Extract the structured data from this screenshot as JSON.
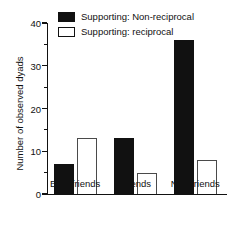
{
  "chart_data": {
    "type": "bar",
    "title": "",
    "xlabel": "",
    "ylabel": "Number of observed dyads",
    "categories": [
      "Best friends",
      "Friends",
      "Non-friends"
    ],
    "series": [
      {
        "name": "Supporting: Non-reciprocal",
        "values": [
          7,
          13,
          36
        ],
        "color": "#111111",
        "style": "filled"
      },
      {
        "name": "Supporting: reciprocal",
        "values": [
          13,
          5,
          8
        ],
        "color": "#ffffff",
        "style": "open"
      }
    ],
    "ylim": [
      0,
      40
    ],
    "yticks": [
      0,
      10,
      20,
      30,
      40
    ],
    "ytick_labels": [
      "0",
      "10",
      "20",
      "30",
      "40"
    ],
    "yminor_ticks": [
      5,
      15,
      25,
      35
    ],
    "grid": false,
    "legend_position": "top-center"
  },
  "legend": {
    "items": [
      {
        "label": "Supporting: Non-reciprocal",
        "style": "filled"
      },
      {
        "label": "Supporting: reciprocal",
        "style": "open"
      }
    ]
  }
}
